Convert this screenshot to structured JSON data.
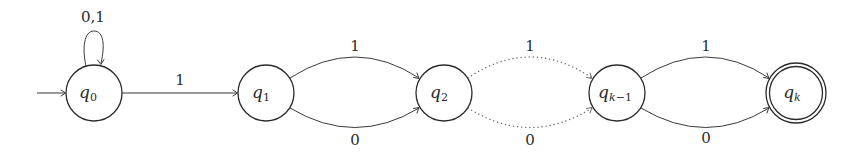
{
  "diagram": {
    "type": "finite-automaton",
    "colors": {
      "stroke": "#2b2b2b",
      "background": "#ffffff",
      "dotted": "#6a6a6a"
    },
    "initial_state": "q0",
    "states": [
      {
        "id": "q0",
        "base": "q",
        "subscript": "0",
        "accepting": false,
        "cx": 94,
        "cy": 93,
        "r": 28
      },
      {
        "id": "q1",
        "base": "q",
        "subscript": "1",
        "accepting": false,
        "cx": 266,
        "cy": 93,
        "r": 28
      },
      {
        "id": "q2",
        "base": "q",
        "subscript": "2",
        "accepting": false,
        "cx": 444,
        "cy": 93,
        "r": 28
      },
      {
        "id": "qk-1",
        "base": "q",
        "subscript": "k−1",
        "accepting": false,
        "cx": 617,
        "cy": 93,
        "r": 28
      },
      {
        "id": "qk",
        "base": "q",
        "subscript": "k",
        "accepting": true,
        "cx": 796,
        "cy": 93,
        "r": 30
      }
    ],
    "transitions": [
      {
        "from": "q0",
        "to": "q0",
        "label": "0,1",
        "style": "solid",
        "kind": "self-loop"
      },
      {
        "from": "q0",
        "to": "q1",
        "label": "1",
        "style": "solid",
        "kind": "straight"
      },
      {
        "from": "q1",
        "to": "q2",
        "label": "1",
        "style": "solid",
        "kind": "arc-top"
      },
      {
        "from": "q1",
        "to": "q2",
        "label": "0",
        "style": "solid",
        "kind": "arc-bottom"
      },
      {
        "from": "q2",
        "to": "qk-1",
        "label": "1",
        "style": "dotted",
        "kind": "arc-top"
      },
      {
        "from": "q2",
        "to": "qk-1",
        "label": "0",
        "style": "dotted",
        "kind": "arc-bottom"
      },
      {
        "from": "qk-1",
        "to": "qk",
        "label": "1",
        "style": "solid",
        "kind": "arc-top"
      },
      {
        "from": "qk-1",
        "to": "qk",
        "label": "0",
        "style": "solid",
        "kind": "arc-bottom"
      }
    ],
    "labels": {
      "loop_q0": "0,1",
      "q0_q1": "1",
      "q1_q2_top": "1",
      "q1_q2_bottom": "0",
      "q2_qk1_top": "1",
      "q2_qk1_bottom": "0",
      "qk1_qk_top": "1",
      "qk1_qk_bottom": "0"
    },
    "state_labels": {
      "q0": {
        "base": "q",
        "sub": "0"
      },
      "q1": {
        "base": "q",
        "sub": "1"
      },
      "q2": {
        "base": "q",
        "sub": "2"
      },
      "qk1": {
        "base": "q",
        "sub_var": "k",
        "sub_rest": "−1"
      },
      "qk": {
        "base": "q",
        "sub": "k"
      }
    }
  }
}
